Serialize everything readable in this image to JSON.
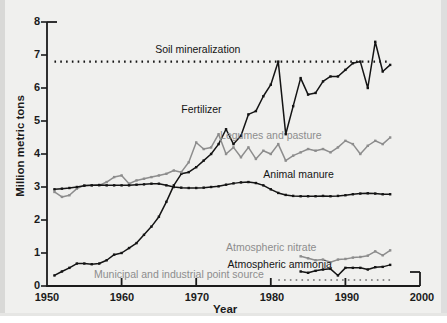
{
  "figure": {
    "background_color": "#f0f0ee",
    "dark_series_color": "#141414",
    "gray_series_color": "#8d8d8d"
  },
  "chart_data": {
    "type": "line",
    "title": "",
    "xlabel": "Year",
    "ylabel": "Million metric tons",
    "xlim": [
      1950,
      2000
    ],
    "ylim": [
      0,
      8
    ],
    "xticks": [
      1950,
      1960,
      1970,
      1980,
      1990,
      2000
    ],
    "yticks": [
      0,
      1,
      2,
      3,
      4,
      5,
      6,
      7,
      8
    ],
    "grid": false,
    "legend_position": "inline-annotations",
    "series": [
      {
        "name": "Soil mineralization",
        "color": "#141414",
        "style": "dotted",
        "markers": false,
        "label_x": 1964.5,
        "label_y": 7.15,
        "label_color": "#141414",
        "x": [
          1951,
          1996
        ],
        "values": [
          6.8,
          6.8
        ]
      },
      {
        "name": "Fertilizer",
        "color": "#141414",
        "style": "solid",
        "markers": true,
        "label_x": 1968.0,
        "label_y": 5.35,
        "label_color": "#141414",
        "x": [
          1951,
          1952,
          1953,
          1954,
          1955,
          1956,
          1957,
          1958,
          1959,
          1960,
          1961,
          1962,
          1963,
          1964,
          1965,
          1966,
          1967,
          1968,
          1969,
          1970,
          1971,
          1972,
          1973,
          1974,
          1975,
          1976,
          1977,
          1978,
          1979,
          1980,
          1981,
          1982,
          1983,
          1984,
          1985,
          1986,
          1987,
          1988,
          1989,
          1990,
          1991,
          1992,
          1993,
          1994,
          1995,
          1996
        ],
        "values": [
          0.32,
          0.44,
          0.55,
          0.68,
          0.68,
          0.66,
          0.68,
          0.78,
          0.95,
          1.0,
          1.15,
          1.3,
          1.55,
          1.8,
          2.1,
          2.55,
          3.05,
          3.4,
          3.45,
          3.6,
          3.8,
          4.0,
          4.3,
          4.75,
          4.3,
          4.55,
          5.2,
          5.3,
          5.75,
          6.1,
          6.8,
          4.6,
          5.45,
          6.3,
          5.8,
          5.85,
          6.2,
          6.35,
          6.35,
          6.55,
          6.75,
          6.8,
          6.0,
          7.4,
          6.5,
          6.7
        ]
      },
      {
        "name": "Legumes and pasture",
        "color": "#8d8d8d",
        "style": "solid",
        "markers": true,
        "label_x": 1973.2,
        "label_y": 4.55,
        "label_color": "#8d8d8d",
        "x": [
          1951,
          1952,
          1953,
          1954,
          1955,
          1956,
          1957,
          1958,
          1959,
          1960,
          1961,
          1962,
          1963,
          1964,
          1965,
          1966,
          1967,
          1968,
          1969,
          1970,
          1971,
          1972,
          1973,
          1974,
          1975,
          1976,
          1977,
          1978,
          1979,
          1980,
          1981,
          1982,
          1983,
          1984,
          1985,
          1986,
          1987,
          1988,
          1989,
          1990,
          1991,
          1992,
          1993,
          1994,
          1995,
          1996
        ],
        "values": [
          2.85,
          2.7,
          2.75,
          2.95,
          3.05,
          3.05,
          3.05,
          3.15,
          3.3,
          3.35,
          3.1,
          3.2,
          3.25,
          3.3,
          3.35,
          3.4,
          3.5,
          3.45,
          3.75,
          4.35,
          4.15,
          4.2,
          4.6,
          4.0,
          4.2,
          3.9,
          4.2,
          3.85,
          4.1,
          4.0,
          4.3,
          3.8,
          3.95,
          4.05,
          4.15,
          4.1,
          4.15,
          4.05,
          4.2,
          4.4,
          4.3,
          4.0,
          4.25,
          4.4,
          4.3,
          4.5
        ]
      },
      {
        "name": "Animal manure",
        "color": "#141414",
        "style": "solid",
        "markers": true,
        "label_x": 1979.0,
        "label_y": 3.35,
        "label_color": "#141414",
        "x": [
          1951,
          1952,
          1953,
          1954,
          1955,
          1956,
          1957,
          1958,
          1959,
          1960,
          1961,
          1962,
          1963,
          1964,
          1965,
          1966,
          1967,
          1968,
          1969,
          1970,
          1971,
          1972,
          1973,
          1974,
          1975,
          1976,
          1977,
          1978,
          1979,
          1980,
          1981,
          1982,
          1983,
          1984,
          1985,
          1986,
          1987,
          1988,
          1989,
          1990,
          1991,
          1992,
          1993,
          1994,
          1995,
          1996
        ],
        "values": [
          2.93,
          2.95,
          2.97,
          3.0,
          3.04,
          3.05,
          3.06,
          3.05,
          3.05,
          3.05,
          3.05,
          3.07,
          3.08,
          3.1,
          3.1,
          3.05,
          3.0,
          2.98,
          2.97,
          2.97,
          2.98,
          3.0,
          3.02,
          3.07,
          3.11,
          3.14,
          3.15,
          3.12,
          3.05,
          2.93,
          2.82,
          2.76,
          2.73,
          2.72,
          2.72,
          2.72,
          2.73,
          2.72,
          2.73,
          2.75,
          2.78,
          2.8,
          2.81,
          2.8,
          2.78,
          2.78
        ]
      },
      {
        "name": "Atmospheric nitrate",
        "color": "#8d8d8d",
        "style": "solid",
        "markers": true,
        "label_x": 1974.0,
        "label_y": 1.15,
        "label_color": "#8d8d8d",
        "x": [
          1984,
          1985,
          1986,
          1987,
          1988,
          1989,
          1990,
          1991,
          1992,
          1993,
          1994,
          1995,
          1996
        ],
        "values": [
          0.9,
          0.84,
          0.78,
          0.8,
          0.72,
          0.8,
          0.82,
          0.86,
          0.88,
          0.92,
          1.05,
          0.93,
          1.08
        ]
      },
      {
        "name": "Atmospheric ammonia",
        "color": "#141414",
        "style": "solid",
        "markers": true,
        "label_x": 1974.2,
        "label_y": 0.65,
        "label_color": "#141414",
        "x": [
          1984,
          1985,
          1986,
          1987,
          1988,
          1989,
          1990,
          1991,
          1992,
          1993,
          1994,
          1995,
          1996
        ],
        "values": [
          0.44,
          0.4,
          0.46,
          0.5,
          0.52,
          0.32,
          0.55,
          0.55,
          0.55,
          0.5,
          0.57,
          0.58,
          0.64
        ]
      },
      {
        "name": "Municipal and industrial point source",
        "color": "#8d8d8d",
        "style": "dotted",
        "markers": false,
        "label_x": 1956.3,
        "label_y": 0.32,
        "label_color": "#8d8d8d",
        "x": [
          1981,
          1996
        ],
        "values": [
          0.18,
          0.18
        ]
      }
    ]
  }
}
